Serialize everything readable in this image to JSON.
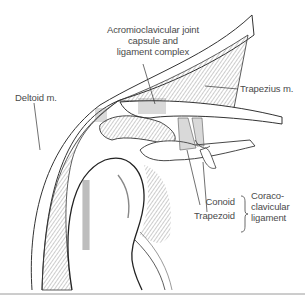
{
  "figure": {
    "labels": {
      "ac_joint": [
        "Acromioclavicular joint",
        "capsule and",
        "ligament complex"
      ],
      "trapezius": "Trapezius m.",
      "deltoid": "Deltoid m.",
      "conoid": "Conoid",
      "trapezoid": "Trapezoid",
      "coracoclavicular": [
        "Coraco-",
        "clavicular",
        "ligament"
      ]
    },
    "colors": {
      "line": "#333333",
      "text": "#4a4a4a",
      "rule": "#9a9a9a",
      "background": "#ffffff"
    }
  }
}
